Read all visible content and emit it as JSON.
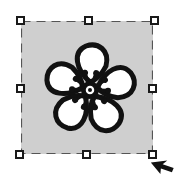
{
  "canvas": {
    "selection_box": {
      "fill_color": "#cfcfcf",
      "border_color": "#555555",
      "border_style": "dashed"
    },
    "handles": [
      "top-left",
      "top-center",
      "top-right",
      "middle-left",
      "middle-right",
      "bottom-left",
      "bottom-center",
      "bottom-right"
    ],
    "image": {
      "icon": "flower-icon",
      "stroke_color": "#111111",
      "fill_color": "#ffffff"
    },
    "cursor": {
      "icon": "arrow-cursor-icon",
      "position": "bottom-right-handle"
    }
  }
}
